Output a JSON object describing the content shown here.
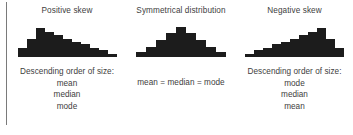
{
  "figure": {
    "background_color": "#ffffff",
    "bar_color": "#1c1c1c",
    "rule_color": "#7a7a7a",
    "text_color": "#404040"
  },
  "panels": [
    {
      "id": "positive-skew",
      "title": "Positive skew",
      "caption_head": "Descending order of size:",
      "caption_items": [
        "mean",
        "median",
        "mode"
      ]
    },
    {
      "id": "symmetrical-distribution",
      "title": "Symmetrical distribution",
      "caption_head": "mean = median = mode",
      "caption_items": []
    },
    {
      "id": "negative-skew",
      "title": "Negative skew",
      "caption_head": "Descending order of size:",
      "caption_items": [
        "mode",
        "median",
        "mean"
      ]
    }
  ],
  "chart_data": [
    {
      "type": "bar",
      "title": "Positive skew",
      "xlabel": "",
      "ylabel": "",
      "categories": [
        "1",
        "2",
        "3",
        "4",
        "5",
        "6",
        "7",
        "8",
        "9",
        "10",
        "11"
      ],
      "values": [
        8,
        16,
        25,
        22,
        19,
        16,
        13,
        11,
        8,
        6,
        3
      ],
      "ylim": [
        0,
        28
      ],
      "grid": false,
      "legend": "none",
      "annotations": [
        "Descending order of size:",
        "mean",
        "median",
        "mode"
      ]
    },
    {
      "type": "bar",
      "title": "Symmetrical distribution",
      "xlabel": "",
      "ylabel": "",
      "categories": [
        "1",
        "2",
        "3",
        "4",
        "5",
        "6",
        "7",
        "8",
        "9"
      ],
      "values": [
        4,
        9,
        15,
        21,
        26,
        21,
        15,
        9,
        4
      ],
      "ylim": [
        0,
        28
      ],
      "grid": false,
      "legend": "none",
      "annotations": [
        "mean = median = mode"
      ]
    },
    {
      "type": "bar",
      "title": "Negative skew",
      "xlabel": "",
      "ylabel": "",
      "categories": [
        "1",
        "2",
        "3",
        "4",
        "5",
        "6",
        "7",
        "8",
        "9",
        "10",
        "11"
      ],
      "values": [
        3,
        6,
        8,
        11,
        13,
        16,
        19,
        22,
        25,
        16,
        8
      ],
      "ylim": [
        0,
        28
      ],
      "grid": false,
      "legend": "none",
      "annotations": [
        "Descending order of size:",
        "mode",
        "median",
        "mean"
      ]
    }
  ]
}
